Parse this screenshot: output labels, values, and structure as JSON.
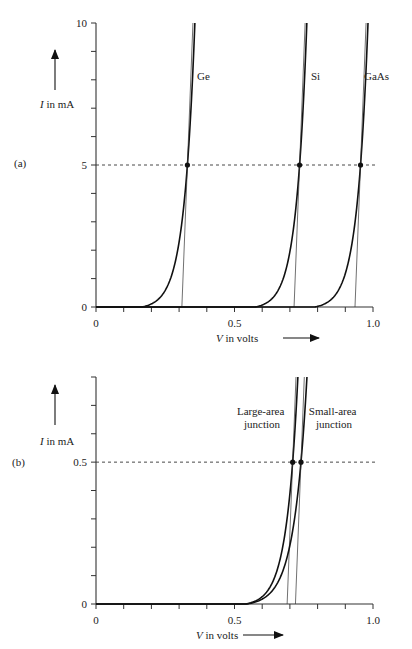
{
  "chart_data": [
    {
      "type": "line",
      "panel_label": "(a)",
      "title": "",
      "xlabel_var": "V",
      "xlabel_rest": " in volts",
      "ylabel_var": "I",
      "ylabel_rest": " in mA",
      "xlim": [
        0,
        1.0
      ],
      "ylim": [
        0,
        10
      ],
      "x_ticks": [
        0,
        0.1,
        0.2,
        0.3,
        0.4,
        0.5,
        0.6,
        0.7,
        0.8,
        0.9,
        1.0
      ],
      "x_tick_labels": {
        "0": "0",
        "0.5": "0.5",
        "1.0": "1.0"
      },
      "y_ticks": [
        0,
        1,
        2,
        3,
        4,
        5,
        6,
        7,
        8,
        9,
        10
      ],
      "y_tick_labels": {
        "0": "0",
        "5": "5",
        "10": "10"
      },
      "grid": false,
      "reference_line": {
        "y": 5,
        "style": "dashed"
      },
      "series": [
        {
          "name": "Ge",
          "turn_on_start": 0.165,
          "point": [
            0.33,
            5
          ],
          "tangent_intercept": 0.31,
          "top_v": 0.335
        },
        {
          "name": "Si",
          "turn_on_start": 0.575,
          "point": [
            0.735,
            5
          ],
          "tangent_intercept": 0.715,
          "top_v": 0.74
        },
        {
          "name": "GaAs",
          "turn_on_start": 0.79,
          "point": [
            0.955,
            5
          ],
          "tangent_intercept": 0.935,
          "top_v": 0.96
        }
      ]
    },
    {
      "type": "line",
      "panel_label": "(b)",
      "title": "",
      "xlabel_var": "V",
      "xlabel_rest": " in volts",
      "ylabel_var": "I",
      "ylabel_rest": " in mA",
      "xlim": [
        0,
        1.0
      ],
      "ylim": [
        0,
        0.8
      ],
      "x_ticks": [
        0,
        0.1,
        0.2,
        0.3,
        0.4,
        0.5,
        0.6,
        0.7,
        0.8,
        0.9,
        1.0
      ],
      "x_tick_labels": {
        "0": "0",
        "0.5": "0.5",
        "1.0": "1.0"
      },
      "y_ticks": [
        0,
        0.1,
        0.2,
        0.3,
        0.4,
        0.5,
        0.6,
        0.7,
        0.8
      ],
      "y_tick_labels": {
        "0": "0",
        "0.5": "0.5"
      },
      "grid": false,
      "reference_line": {
        "y": 0.5,
        "style": "dashed"
      },
      "series": [
        {
          "name": "Large-area junction",
          "label_lines": [
            "Large-area",
            "junction"
          ],
          "turn_on_start": 0.54,
          "point": [
            0.71,
            0.5
          ],
          "tangent_intercept": 0.69,
          "top_v": 0.72
        },
        {
          "name": "Small-area junction",
          "label_lines": [
            "Small-area",
            "junction"
          ],
          "turn_on_start": 0.545,
          "point": [
            0.74,
            0.5
          ],
          "tangent_intercept": 0.72,
          "top_v": 0.75
        }
      ]
    }
  ]
}
